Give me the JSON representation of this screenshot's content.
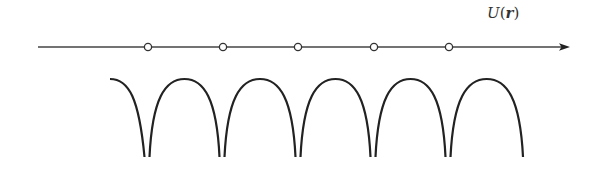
{
  "diagram": {
    "label": {
      "func": "U",
      "open": "(",
      "var": "r",
      "close": ")"
    },
    "axis": {
      "y": 47,
      "x_start": 38,
      "x_end": 570,
      "color": "#444444"
    },
    "lattice_sites": [
      148,
      223,
      298,
      374,
      449
    ],
    "potential": {
      "peak_y": 79,
      "cusp_y": 157,
      "cusps": [
        147,
        222,
        298,
        373,
        448
      ],
      "left_start_x": 110,
      "right_end_x": 523,
      "color": "#222222"
    }
  }
}
